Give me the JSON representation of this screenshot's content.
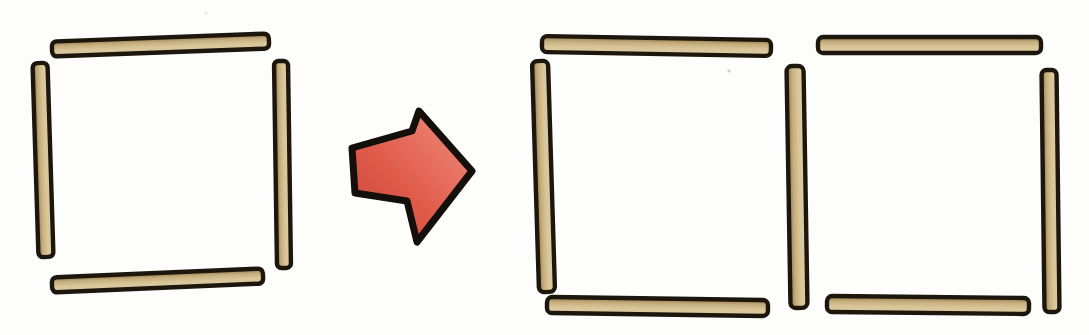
{
  "illustration": {
    "kind": "matchstick-puzzle-transformation",
    "canvas": {
      "width": 1089,
      "height": 335,
      "background": "#fdfdfb"
    }
  },
  "palette": {
    "stick_outline": "#1d160d",
    "stick_dark": "#8f7643",
    "stick_mid": "#c6ae7e",
    "stick_light": "#d8c598",
    "stick_lightest": "#ddcda5",
    "arrow_outline": "#150f0b",
    "arrow_dark": "#c4473b",
    "arrow_mid": "#e05a4a",
    "arrow_light": "#f0907f",
    "speck": "#9a958c"
  },
  "before_figure": {
    "figure": "one-square",
    "stick_count": 4,
    "sticks": [
      {
        "id": "top",
        "x1": 52,
        "y1": 49,
        "x2": 269,
        "y2": 41,
        "th": 15
      },
      {
        "id": "left",
        "x1": 40,
        "y1": 63,
        "x2": 46,
        "y2": 257,
        "th": 15
      },
      {
        "id": "right",
        "x1": 281,
        "y1": 61,
        "x2": 284,
        "y2": 268,
        "th": 14
      },
      {
        "id": "bottom",
        "x1": 52,
        "y1": 285,
        "x2": 263,
        "y2": 276,
        "th": 15
      }
    ]
  },
  "transform_arrow": {
    "direction": "right",
    "points": [
      [
        352,
        148
      ],
      [
        412,
        131
      ],
      [
        419,
        111
      ],
      [
        472,
        171
      ],
      [
        417,
        242
      ],
      [
        407,
        201
      ],
      [
        355,
        193
      ]
    ],
    "outline_width": 7
  },
  "after_figure": {
    "figure": "two-squares-sharing-middle-stick",
    "stick_count": 7,
    "sticks": [
      {
        "id": "left-square-top",
        "x1": 542,
        "y1": 44,
        "x2": 771,
        "y2": 48,
        "th": 16
      },
      {
        "id": "left-square-left",
        "x1": 540,
        "y1": 61,
        "x2": 547,
        "y2": 292,
        "th": 16
      },
      {
        "id": "left-square-bottom",
        "x1": 547,
        "y1": 305,
        "x2": 768,
        "y2": 308,
        "th": 16
      },
      {
        "id": "shared-middle",
        "x1": 795,
        "y1": 66,
        "x2": 799,
        "y2": 308,
        "th": 17
      },
      {
        "id": "right-square-top",
        "x1": 818,
        "y1": 45,
        "x2": 1041,
        "y2": 45,
        "th": 16
      },
      {
        "id": "right-square-right",
        "x1": 1049,
        "y1": 70,
        "x2": 1052,
        "y2": 312,
        "th": 15
      },
      {
        "id": "right-square-bottom",
        "x1": 827,
        "y1": 304,
        "x2": 1029,
        "y2": 306,
        "th": 16
      }
    ]
  },
  "paper_specks": [
    {
      "x": 206,
      "y": 13,
      "r": 1.6,
      "opacity": 0.25
    },
    {
      "x": 729,
      "y": 71,
      "r": 1.6,
      "opacity": 0.45
    }
  ]
}
